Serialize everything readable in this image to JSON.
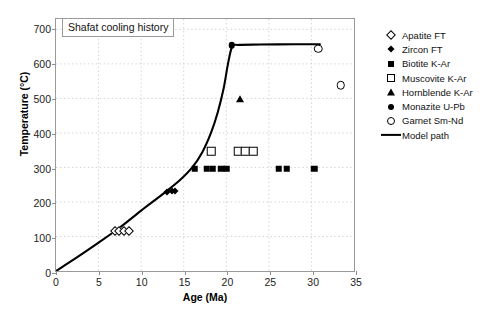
{
  "chart_data": {
    "type": "scatter",
    "title": "Shafat cooling history",
    "xlabel": "Age (Ma)",
    "ylabel": "Temperature (°C)",
    "xlim": [
      0,
      35
    ],
    "ylim": [
      0,
      730
    ],
    "xticks": [
      0,
      5,
      10,
      15,
      20,
      25,
      30,
      35
    ],
    "yticks": [
      0,
      100,
      200,
      300,
      400,
      500,
      600,
      700
    ],
    "grid": true,
    "legend_position": "right-outside",
    "series": [
      {
        "name": "Apatite FT",
        "marker": "open-diamond",
        "points": [
          [
            6.9,
            120
          ],
          [
            7.4,
            120
          ],
          [
            7.9,
            122
          ],
          [
            8.5,
            122
          ]
        ]
      },
      {
        "name": "Zircon FT",
        "marker": "filled-diamond",
        "points": [
          [
            13.0,
            233
          ],
          [
            13.5,
            236
          ],
          [
            13.9,
            235
          ]
        ]
      },
      {
        "name": "Biotite K-Ar",
        "marker": "filled-square",
        "points": [
          [
            16.2,
            300
          ],
          [
            17.6,
            300
          ],
          [
            18.3,
            300
          ],
          [
            19.3,
            300
          ],
          [
            19.9,
            300
          ],
          [
            26.0,
            300
          ],
          [
            26.9,
            300
          ],
          [
            30.1,
            300
          ]
        ]
      },
      {
        "name": "Muscovite K-Ar",
        "marker": "open-square",
        "points": [
          [
            18.1,
            350
          ],
          [
            21.2,
            350
          ],
          [
            22.1,
            350
          ],
          [
            23.0,
            350
          ]
        ]
      },
      {
        "name": "Hornblende K-Ar",
        "marker": "triangle",
        "points": [
          [
            21.5,
            500
          ]
        ]
      },
      {
        "name": "Monazite U-Pb",
        "marker": "filled-circle",
        "points": [
          [
            20.5,
            655
          ]
        ]
      },
      {
        "name": "Garnet Sm-Nd",
        "marker": "open-circle",
        "points": [
          [
            30.6,
            645
          ],
          [
            33.2,
            540
          ]
        ]
      },
      {
        "name": "Model path",
        "marker": "line",
        "points": [
          [
            0,
            0
          ],
          [
            2.5,
            40
          ],
          [
            5.0,
            82
          ],
          [
            7.5,
            126
          ],
          [
            10.0,
            175
          ],
          [
            12.5,
            222
          ],
          [
            14.5,
            262
          ],
          [
            16.0,
            300
          ],
          [
            17.2,
            345
          ],
          [
            18.2,
            400
          ],
          [
            19.0,
            460
          ],
          [
            19.7,
            530
          ],
          [
            20.2,
            600
          ],
          [
            20.7,
            650
          ],
          [
            21.5,
            655
          ],
          [
            24.0,
            656
          ],
          [
            28.0,
            657
          ],
          [
            31.0,
            657
          ]
        ]
      }
    ]
  },
  "legend": {
    "entries": [
      {
        "label": "Apatite FT",
        "marker": "open-diamond"
      },
      {
        "label": "Zircon FT",
        "marker": "filled-diamond"
      },
      {
        "label": "Biotite K-Ar",
        "marker": "filled-square"
      },
      {
        "label": "Muscovite K-Ar",
        "marker": "open-square"
      },
      {
        "label": "Hornblende K-Ar",
        "marker": "triangle"
      },
      {
        "label": "Monazite U-Pb",
        "marker": "filled-circle"
      },
      {
        "label": "Garnet Sm-Nd",
        "marker": "open-circle"
      },
      {
        "label": "Model path",
        "marker": "line"
      }
    ]
  }
}
